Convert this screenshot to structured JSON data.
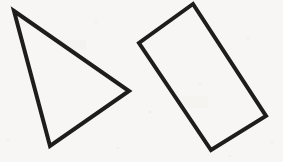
{
  "canvas": {
    "width": 283,
    "height": 162,
    "background_color": "#f7f6f4",
    "paper_tint": "#efedea",
    "description": "Scanned black-and-white drawing of two geometric outline shapes"
  },
  "stroke": {
    "color": "#1d1d1d",
    "width": 4,
    "linejoin": "miter",
    "linecap": "round"
  },
  "shapes": [
    {
      "id": "triangle",
      "name": "triangle",
      "label": "Triangle",
      "sides": 3,
      "fill": "none",
      "stroke_color": "#1d1d1d",
      "stroke_width": 4,
      "points": "14,11 129,91 50,146",
      "vertices": [
        {
          "name": "apex",
          "x": 14,
          "y": 11
        },
        {
          "name": "right",
          "x": 129,
          "y": 91
        },
        {
          "name": "bottom",
          "x": 50,
          "y": 146
        }
      ]
    },
    {
      "id": "quadrilateral",
      "name": "rectangle",
      "label": "Rotated rectangle",
      "sides": 4,
      "fill": "none",
      "stroke_color": "#1d1d1d",
      "stroke_width": 4,
      "points": "193,4 266,116 211,150 139,43",
      "vertices": [
        {
          "name": "top",
          "x": 193,
          "y": 4
        },
        {
          "name": "right",
          "x": 266,
          "y": 116
        },
        {
          "name": "bottom",
          "x": 211,
          "y": 150
        },
        {
          "name": "left",
          "x": 139,
          "y": 43
        }
      ]
    }
  ]
}
